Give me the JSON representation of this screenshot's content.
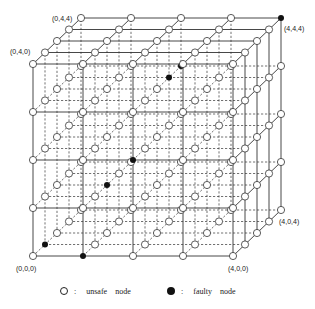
{
  "figure": {
    "type": "3D mesh (5x5x5) with fault nodes",
    "dimension": 5,
    "labels": [
      {
        "text": "(0,4,4)",
        "x": 52,
        "y": 15
      },
      {
        "text": "(4,4,4)",
        "x": 284,
        "y": 25
      },
      {
        "text": "(0,4,0)",
        "x": 10,
        "y": 48
      },
      {
        "text": "(4,0,4)",
        "x": 279,
        "y": 218
      },
      {
        "text": "(0,0,0)",
        "x": 16,
        "y": 265
      },
      {
        "text": "(4,0,0)",
        "x": 228,
        "y": 265
      }
    ],
    "faulty_nodes": [
      [
        4,
        4,
        4
      ],
      [
        2,
        3,
        4
      ],
      [
        2,
        3,
        3
      ],
      [
        2,
        2,
        0
      ],
      [
        1,
        1,
        2
      ],
      [
        0,
        0,
        1
      ],
      [
        1,
        0,
        0
      ]
    ],
    "geometry": {
      "origin": [
        33,
        256
      ],
      "x_step": [
        50,
        0
      ],
      "y_step": [
        0,
        -48
      ],
      "z_step": [
        12,
        -11.5
      ],
      "node_radius": 3.6
    }
  },
  "legend": {
    "unsafe": {
      "symbol": "○",
      "colon": ":",
      "word1": "unsafe",
      "word2": "node"
    },
    "faulty": {
      "symbol": "●",
      "colon": ":",
      "word1": "faulty",
      "word2": "node"
    }
  }
}
